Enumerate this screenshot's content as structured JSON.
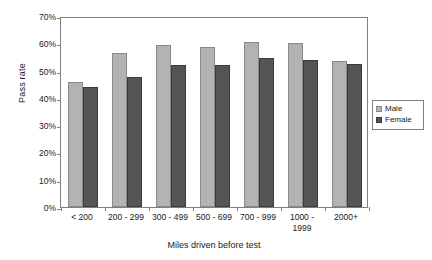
{
  "chart_data": {
    "type": "bar",
    "title": "",
    "xlabel": "Miles driven before test",
    "ylabel": "Pass rate",
    "categories": [
      "< 200",
      "200 - 299",
      "300 - 499",
      "500 - 699",
      "700 - 999",
      "1000 - 1999",
      "2000+"
    ],
    "series": [
      {
        "name": "Male",
        "color": "#b3b3b3",
        "values": [
          46,
          56.5,
          59.5,
          58.5,
          60.5,
          60,
          53.5
        ]
      },
      {
        "name": "Female",
        "color": "#555555",
        "values": [
          44,
          47.5,
          52,
          52,
          54.5,
          54,
          52.5
        ]
      }
    ],
    "ylim": [
      0,
      70
    ],
    "ytick_values": [
      70,
      60,
      50,
      40,
      30,
      20,
      10,
      0
    ],
    "ytick_labels": [
      "70%",
      "60%",
      "50%",
      "40%",
      "30%",
      "20%",
      "10%",
      "0%"
    ],
    "grid": false,
    "legend_position": "right",
    "value_unit": "%"
  },
  "legend": {
    "entries": [
      {
        "label": "Male",
        "swatch": "male-swatch-icon"
      },
      {
        "label": "Female",
        "swatch": "female-swatch-icon"
      }
    ]
  }
}
